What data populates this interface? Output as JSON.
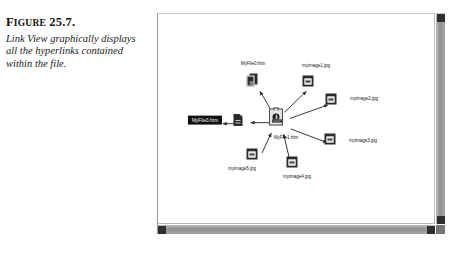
{
  "caption": {
    "figure_label_lead": "F",
    "figure_label_rest": "IGURE",
    "figure_number": "25.7.",
    "description": "Link View graphically displays all the hyperlinks contained within the file."
  },
  "window": {
    "scrollbars": {
      "vertical_up_button": "scroll-up",
      "vertical_down_button": "scroll-down",
      "horizontal_left_button": "scroll-left",
      "horizontal_right_button": "scroll-right"
    }
  },
  "diagram": {
    "title": "Link View",
    "nodes": [
      {
        "id": "root",
        "label": "MyFile1.htm",
        "icon": "web-page-icon",
        "type": "root",
        "selected": false,
        "x": 118,
        "y": 103,
        "label_x": 128,
        "label_y": 124
      },
      {
        "id": "myfile0",
        "label": "MyFile0.htm",
        "icon": "page-stack-icon",
        "type": "page",
        "selected": false,
        "x": 94,
        "y": 66,
        "label_x": 95,
        "label_y": 52
      },
      {
        "id": "selected",
        "label": "MyFile3.htm",
        "icon": "selected-label",
        "type": "selected",
        "selected": true,
        "x": 47,
        "y": 106,
        "label_x": 47,
        "label_y": 106
      },
      {
        "id": "leftpage",
        "label": "",
        "icon": "page-icon",
        "type": "page",
        "selected": false,
        "x": 80,
        "y": 106,
        "label_x": 80,
        "label_y": 106
      },
      {
        "id": "myimage1",
        "label": "myimage1.jpg",
        "icon": "image-icon",
        "type": "image",
        "selected": false,
        "x": 150,
        "y": 67,
        "label_x": 158,
        "label_y": 52
      },
      {
        "id": "myimage2",
        "label": "myimage2.jpg",
        "icon": "image-icon",
        "type": "image",
        "selected": false,
        "x": 173,
        "y": 85,
        "label_x": 206,
        "label_y": 85
      },
      {
        "id": "myimage3",
        "label": "myimage3.jpg",
        "icon": "image-icon",
        "type": "image",
        "selected": false,
        "x": 172,
        "y": 125,
        "label_x": 205,
        "label_y": 127
      },
      {
        "id": "myimage4",
        "label": "myimage4.jpg",
        "icon": "image-icon",
        "type": "image",
        "selected": false,
        "x": 134,
        "y": 148,
        "label_x": 139,
        "label_y": 163
      },
      {
        "id": "myimage5",
        "label": "myimage5.jpg",
        "icon": "image-icon",
        "type": "image",
        "selected": false,
        "x": 94,
        "y": 140,
        "label_x": 84,
        "label_y": 155
      }
    ],
    "links": [
      {
        "from": "root",
        "to": "myfile0",
        "direction": "out"
      },
      {
        "from": "root",
        "to": "leftpage",
        "direction": "out"
      },
      {
        "from": "root",
        "to": "myimage1",
        "direction": "out"
      },
      {
        "from": "root",
        "to": "myimage2",
        "direction": "out"
      },
      {
        "from": "root",
        "to": "myimage3",
        "direction": "out"
      },
      {
        "from": "root",
        "to": "myimage4",
        "direction": "in"
      },
      {
        "from": "root",
        "to": "myimage5",
        "direction": "in"
      },
      {
        "from": "leftpage",
        "to": "selected",
        "direction": "out"
      }
    ]
  },
  "colors": {
    "page_background": "#ffffff",
    "window_border": "#9a9a9a",
    "scrollbar": "#9d9d9d",
    "scroll_button": "#2e2e2e",
    "icon_dark": "#2b2b2b",
    "selection_background": "#111111",
    "selection_text": "#ffffff",
    "link_line": "#2a2a2a"
  }
}
